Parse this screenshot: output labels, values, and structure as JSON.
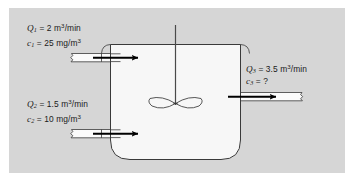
{
  "figure": {
    "name": "mixing-tank-mass-balance-diagram",
    "panel_background": "#d6d6d6",
    "page_background": "#ffffff",
    "tank_fill": "#f7f7f7",
    "pipe_fill": "#fbfbfb",
    "line_color": "#3a3a3a",
    "arrow_color": "#000000",
    "text_color": "#1a1a1a"
  },
  "streams": {
    "inlet_1": {
      "flow_symbol": "Q",
      "flow_subscript": "1",
      "flow_equals": "=",
      "flow_value": "2",
      "flow_units_prefix": "m",
      "flow_units_exponent": "3",
      "flow_units_suffix": "/min",
      "conc_symbol": "c",
      "conc_subscript": "1",
      "conc_equals": "=",
      "conc_value": "25",
      "conc_units_prefix": "mg/m",
      "conc_units_exponent": "3"
    },
    "inlet_2": {
      "flow_symbol": "Q",
      "flow_subscript": "2",
      "flow_equals": "=",
      "flow_value": "1.5",
      "flow_units_prefix": "m",
      "flow_units_exponent": "3",
      "flow_units_suffix": "/min",
      "conc_symbol": "c",
      "conc_subscript": "2",
      "conc_equals": "=",
      "conc_value": "10",
      "conc_units_prefix": "mg/m",
      "conc_units_exponent": "3"
    },
    "outlet_3": {
      "flow_symbol": "Q",
      "flow_subscript": "3",
      "flow_equals": "=",
      "flow_value": "3.5",
      "flow_units_prefix": "m",
      "flow_units_exponent": "3",
      "flow_units_suffix": "/min",
      "conc_symbol": "c",
      "conc_subscript": "3",
      "conc_equals": "=",
      "conc_value": "?",
      "conc_units_prefix": "",
      "conc_units_exponent": ""
    }
  },
  "parts": {
    "tank": "mixing-tank",
    "impeller": "impeller-blades",
    "shaft": "impeller-shaft",
    "inlet_pipe_1": "inlet-pipe-top",
    "inlet_pipe_2": "inlet-pipe-bottom",
    "outlet_pipe": "outlet-pipe",
    "arrow_in_1": "flow-arrow-inlet-1",
    "arrow_in_2": "flow-arrow-inlet-2",
    "arrow_out": "flow-arrow-outlet"
  }
}
